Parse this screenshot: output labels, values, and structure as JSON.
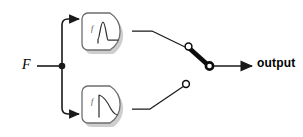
{
  "diagram": {
    "title": "",
    "type": "block-diagram",
    "input": {
      "label": "F",
      "style": "italic-serif"
    },
    "output": {
      "label": "output",
      "style": "bold-sans"
    },
    "junction": {
      "name": "branch-node",
      "shape": "filled-dot"
    },
    "blocks": [
      {
        "id": "top",
        "function_label": "f",
        "shape": "d-shape-rounded",
        "curve": "pulse-peak",
        "description": "rising peak then decay to flat baseline",
        "fill": "#ffffff",
        "stroke": "#6e6e6e",
        "shadow": "#b9b9b9"
      },
      {
        "id": "bottom",
        "function_label": "f",
        "shape": "d-shape-rounded",
        "curve": "exponential-decay",
        "description": "vertical rise then exponential decay",
        "fill": "#ffffff",
        "stroke": "#6e6e6e",
        "shadow": "#b9b9b9"
      }
    ],
    "switch": {
      "name": "selector-switch",
      "state": "upper-contact-closed",
      "upper_terminal": "open-circle",
      "lower_terminal": "open-circle",
      "pole": "ring-circle",
      "blade": "thick-bar"
    },
    "colors": {
      "wire": "#1a1a1a",
      "block_stroke": "#6e6e6e",
      "block_shadow": "#b9b9b9",
      "curve": "#333333",
      "text": "#000000",
      "background": "#ffffff"
    }
  }
}
